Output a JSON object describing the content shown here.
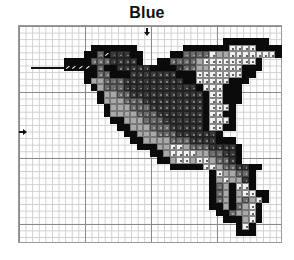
{
  "header": {
    "title": "Blue"
  },
  "grid": {
    "origin_x": 18,
    "origin_y": 25,
    "cell": 6.6,
    "cols": 40,
    "rows": 33,
    "major_every": 10
  },
  "markers": {
    "center_top": {
      "x": 147,
      "y": 28,
      "icon": "arrow-down-icon"
    },
    "center_left": {
      "x": 19,
      "y": 132,
      "icon": "arrow-right-icon"
    }
  },
  "legend_shades": {
    "1": "#0b0b0b",
    "2": "#3a3a3a",
    "3": "#6c6c6c",
    "4": "#a9a9a9",
    "5": "#f2f2f2",
    "6": "eye"
  },
  "beak": {
    "line_from_col": 2,
    "line_to_col": 7.2,
    "row": 6
  },
  "pattern_rows": [
    {
      "r": 2,
      "c": 31,
      "cells": "1111111"
    },
    {
      "r": 3,
      "c": 11,
      "cells": "1111111"
    },
    {
      "r": 3,
      "c": 25,
      "cells": "111111155551111"
    },
    {
      "r": 4,
      "c": 10,
      "cells": "113622211"
    },
    {
      "r": 4,
      "c": 23,
      "cells": "11333354455555551"
    },
    {
      "r": 5,
      "c": 7,
      "cells": "111133322221"
    },
    {
      "r": 5,
      "c": 21,
      "cells": "1133334555555551"
    },
    {
      "r": 6,
      "c": 7,
      "cells": "5555131122222111"
    },
    {
      "r": 6,
      "c": 23,
      "cells": "12334455555111"
    },
    {
      "r": 7,
      "c": 10,
      "cells": "1133111222222211"
    },
    {
      "r": 7,
      "c": 26,
      "cells": "1555555511"
    },
    {
      "r": 8,
      "c": 10,
      "cells": "1443332222222221"
    },
    {
      "r": 8,
      "c": 26,
      "cells": "155555111"
    },
    {
      "r": 9,
      "c": 11,
      "cells": "1433322222222222"
    },
    {
      "r": 9,
      "c": 27,
      "cells": "1555111"
    },
    {
      "r": 10,
      "c": 12,
      "cells": "14433222222222221"
    },
    {
      "r": 10,
      "c": 29,
      "cells": "55111"
    },
    {
      "r": 11,
      "c": 12,
      "cells": "1444333222222222155"
    },
    {
      "r": 11,
      "c": 31,
      "cells": "111"
    },
    {
      "r": 12,
      "c": 13,
      "cells": "14443332222222215551"
    },
    {
      "r": 13,
      "c": 13,
      "cells": "1444433322222221555"
    },
    {
      "r": 13,
      "c": 31,
      "cells": "11"
    },
    {
      "r": 14,
      "c": 14,
      "cells": "114443332222221555"
    },
    {
      "r": 14,
      "c": 32,
      "cells": "1"
    },
    {
      "r": 15,
      "c": 15,
      "cells": "1144433322222155"
    },
    {
      "r": 15,
      "c": 31,
      "cells": "11"
    },
    {
      "r": 16,
      "c": 16,
      "cells": "114443332222221"
    },
    {
      "r": 17,
      "c": 17,
      "cells": "1144443332222111"
    },
    {
      "r": 18,
      "c": 18,
      "cells": "1114455433322221"
    },
    {
      "r": 19,
      "c": 20,
      "cells": "11455554433221"
    },
    {
      "r": 20,
      "c": 21,
      "cells": "1145545543321"
    },
    {
      "r": 21,
      "c": 23,
      "cells": "11111554332211"
    },
    {
      "r": 22,
      "c": 29,
      "cells": "1544331"
    },
    {
      "r": 23,
      "c": 29,
      "cells": "1454421"
    },
    {
      "r": 24,
      "c": 29,
      "cells": "1341551"
    },
    {
      "r": 25,
      "c": 29,
      "cells": "134145511"
    },
    {
      "r": 26,
      "c": 29,
      "cells": "134143451"
    },
    {
      "r": 27,
      "c": 29,
      "cells": "11413451"
    },
    {
      "r": 28,
      "c": 30,
      "cells": "1134451"
    },
    {
      "r": 29,
      "c": 31,
      "cells": "111451"
    },
    {
      "r": 30,
      "c": 33,
      "cells": "151"
    },
    {
      "r": 31,
      "c": 33,
      "cells": "111"
    }
  ]
}
